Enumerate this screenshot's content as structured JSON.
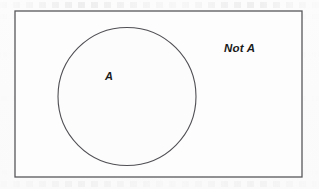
{
  "diagram": {
    "kind": "venn-diagram",
    "universe": {
      "shape": "rectangle",
      "stroke_color": "#58585c",
      "fill_color": "#fdfdfd",
      "x": 15,
      "y": 11,
      "width": 287,
      "height": 166,
      "stroke_width": 1.3
    },
    "set_a": {
      "shape": "circle",
      "stroke_color": "#4f4f54",
      "fill_color": "#fcfcfc",
      "cx": 127,
      "cy": 96.5,
      "r": 69,
      "stroke_width": 1.1
    },
    "labels": {
      "inside_label": "A",
      "outside_label": "Not A"
    },
    "colors": {
      "background": "#fdfdfd",
      "ink": "#1b1b1b",
      "line": "#58585c"
    }
  }
}
